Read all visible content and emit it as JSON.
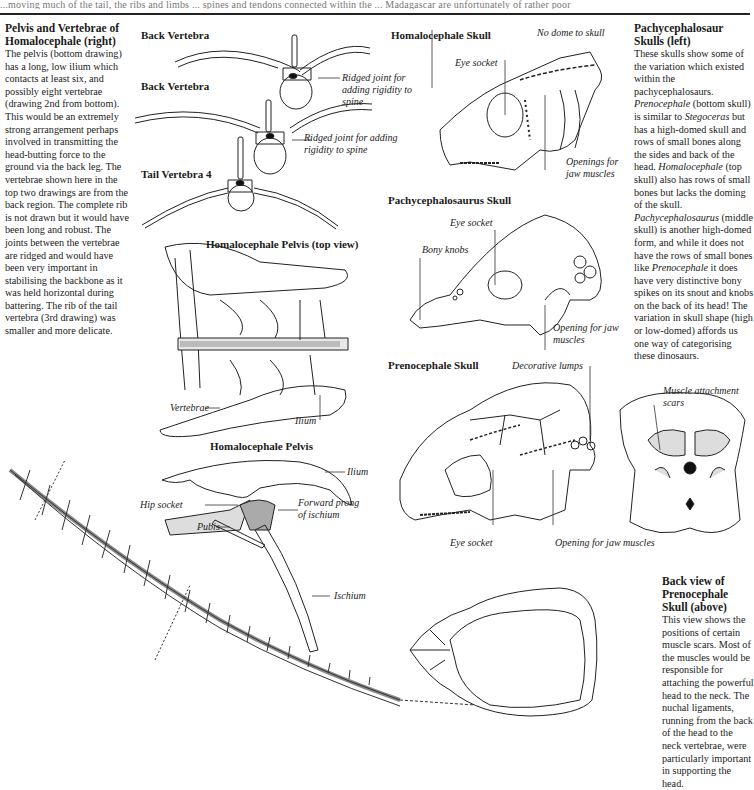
{
  "page": {
    "top_cutoff_text": "...moving much of the tail, the ribs and limbs ... spines and tendons connected within the ... Madagascar are unfortunately of rather poor"
  },
  "left_column": {
    "heading": "Pelvis and Vertebrae of Homalocephale (right)",
    "body": "The pelvis (bottom drawing) has a long, low ilium which contacts at least six, and possibly eight vertebrae (drawing 2nd from bottom). This would be an extremely strong arrangement perhaps involved in transmitting the head-butting force to the ground via the back leg. The vertebrae shown here in the top two drawings are from the back region. The complete rib is not drawn but it would have been long and robust. The joints between the vertebrae are ridged and would have been very important in stabilising the backbone as it was held horizontal during battering. The rib of the tail vertebra (3rd drawing) was smaller and more delicate."
  },
  "right_column": {
    "heading": "Pachycephalosaur Skulls (left)",
    "body_parts": [
      {
        "text": "These skulls show some of the variation which existed within the pachycephalosaurs. ",
        "italic": false
      },
      {
        "text": "Prenocephale",
        "italic": true
      },
      {
        "text": " (bottom skull) is similar to ",
        "italic": false
      },
      {
        "text": "Stegoceras",
        "italic": true
      },
      {
        "text": " but has a high-domed skull and rows of small bones along the sides and back of the head. ",
        "italic": false
      },
      {
        "text": "Homalocephale",
        "italic": true
      },
      {
        "text": " (top skull) also has rows of small bones but lacks the doming of the skull. ",
        "italic": false
      },
      {
        "text": "Pachycephalosaurus",
        "italic": true
      },
      {
        "text": " (middle skull) is another high-domed form, and while it does not have the rows of small bones like ",
        "italic": false
      },
      {
        "text": "Prenocephale",
        "italic": true
      },
      {
        "text": " it does have very distinctive bony spikes on its snout and knobs on the back of its head! The variation in skull shape (high or low-domed) affords us one way of categorising these dinosaurs.",
        "italic": false
      }
    ]
  },
  "back_view": {
    "heading": "Back view of Prenocephale Skull (above)",
    "body": "This view shows the positions of certain muscle scars. Most of the muscles would be responsible for attaching the powerful head to the neck. The nuchal ligaments, running from the back of the head to the neck vertebrae, were particularly important in supporting the head.",
    "label_muscle": "Muscle attachment scars"
  },
  "figures": {
    "back_vertebra_1": {
      "title": "Back Vertebra",
      "label": "Ridged joint for adding rigidity to spine"
    },
    "back_vertebra_2": {
      "title": "Back Vertebra",
      "label": "Ridged joint for adding rigidity to spine"
    },
    "tail_vertebra": {
      "title": "Tail Vertebra 4"
    },
    "pelvis_top": {
      "title": "Homalocephale Pelvis (top view)",
      "label_vertebrae": "Vertebrae",
      "label_ilium": "Ilium"
    },
    "pelvis_side": {
      "title": "Homalocephale Pelvis",
      "label_ilium": "Ilium",
      "label_hip": "Hip socket",
      "label_pubis": "Pubis",
      "label_prong": "Forward prong of ischium",
      "label_ischium": "Ischium"
    },
    "homalocephale_skull": {
      "title": "Homalocephale Skull",
      "label_dome": "No dome to skull",
      "label_eye": "Eye socket",
      "label_openings": "Openings for jaw muscles"
    },
    "pachycephalosaurus_skull": {
      "title": "Pachycephalosaurus Skull",
      "label_eye": "Eye socket",
      "label_knobs": "Bony knobs",
      "label_opening": "Opening for jaw muscles"
    },
    "prenocephale_skull": {
      "title": "Prenocephale Skull",
      "label_lumps": "Decorative lumps",
      "label_eye": "Eye socket",
      "label_opening": "Opening for jaw muscles"
    }
  }
}
